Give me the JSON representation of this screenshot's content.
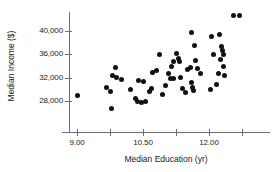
{
  "chart_data": {
    "type": "scatter",
    "title": "",
    "xlabel": "Median Education (yr)",
    "ylabel": "Median Income ($)",
    "xlim": [
      8.6,
      13.1
    ],
    "ylim": [
      25600,
      43200
    ],
    "grid": false,
    "legend": null,
    "x_ticks": [
      {
        "value": 9.0,
        "label": "9.00"
      },
      {
        "value": 9.75,
        "label": ""
      },
      {
        "value": 10.5,
        "label": "10.50"
      },
      {
        "value": 11.25,
        "label": ""
      },
      {
        "value": 12.0,
        "label": "12.00"
      },
      {
        "value": 12.75,
        "label": ""
      }
    ],
    "y_ticks": [
      {
        "value": 40000,
        "label": "40,000"
      },
      {
        "value": 36000,
        "label": "36,000"
      },
      {
        "value": 32000,
        "label": "32,000"
      },
      {
        "value": 28000,
        "label": "28,000"
      }
    ],
    "points": [
      {
        "x": 9.0,
        "y": 28900
      },
      {
        "x": 9.67,
        "y": 30300
      },
      {
        "x": 9.78,
        "y": 26700
      },
      {
        "x": 9.88,
        "y": 33700
      },
      {
        "x": 9.8,
        "y": 32300
      },
      {
        "x": 9.9,
        "y": 32000
      },
      {
        "x": 10.0,
        "y": 31700
      },
      {
        "x": 9.75,
        "y": 29700
      },
      {
        "x": 10.22,
        "y": 29900
      },
      {
        "x": 10.4,
        "y": 31500
      },
      {
        "x": 10.32,
        "y": 28400
      },
      {
        "x": 10.38,
        "y": 27900
      },
      {
        "x": 10.46,
        "y": 27800
      },
      {
        "x": 10.55,
        "y": 28000
      },
      {
        "x": 10.5,
        "y": 31300
      },
      {
        "x": 10.64,
        "y": 29600
      },
      {
        "x": 10.72,
        "y": 32900
      },
      {
        "x": 10.8,
        "y": 33300
      },
      {
        "x": 10.88,
        "y": 36000
      },
      {
        "x": 10.7,
        "y": 30100
      },
      {
        "x": 10.95,
        "y": 29100
      },
      {
        "x": 11.02,
        "y": 30700
      },
      {
        "x": 11.08,
        "y": 32700
      },
      {
        "x": 11.14,
        "y": 33900
      },
      {
        "x": 11.2,
        "y": 34700
      },
      {
        "x": 11.26,
        "y": 36200
      },
      {
        "x": 11.3,
        "y": 35300
      },
      {
        "x": 11.32,
        "y": 34800
      },
      {
        "x": 11.12,
        "y": 31800
      },
      {
        "x": 11.2,
        "y": 31900
      },
      {
        "x": 11.36,
        "y": 32100
      },
      {
        "x": 11.4,
        "y": 30100
      },
      {
        "x": 11.46,
        "y": 29400
      },
      {
        "x": 11.52,
        "y": 33400
      },
      {
        "x": 11.58,
        "y": 33700
      },
      {
        "x": 11.6,
        "y": 39700
      },
      {
        "x": 11.66,
        "y": 37500
      },
      {
        "x": 11.7,
        "y": 34900
      },
      {
        "x": 11.74,
        "y": 33500
      },
      {
        "x": 11.6,
        "y": 31200
      },
      {
        "x": 11.62,
        "y": 30400
      },
      {
        "x": 11.64,
        "y": 29800
      },
      {
        "x": 11.8,
        "y": 32800
      },
      {
        "x": 12.06,
        "y": 39000
      },
      {
        "x": 12.1,
        "y": 36000
      },
      {
        "x": 12.04,
        "y": 29900
      },
      {
        "x": 12.18,
        "y": 30900
      },
      {
        "x": 12.24,
        "y": 39400
      },
      {
        "x": 12.28,
        "y": 37400
      },
      {
        "x": 12.3,
        "y": 36600
      },
      {
        "x": 12.32,
        "y": 35900
      },
      {
        "x": 12.26,
        "y": 35100
      },
      {
        "x": 12.34,
        "y": 34000
      },
      {
        "x": 12.22,
        "y": 32700
      },
      {
        "x": 12.36,
        "y": 32300
      },
      {
        "x": 12.56,
        "y": 42600
      },
      {
        "x": 12.7,
        "y": 42600
      }
    ]
  }
}
